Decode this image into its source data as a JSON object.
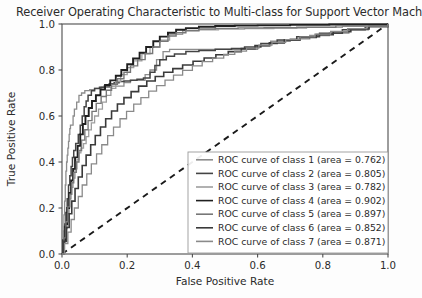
{
  "chart_data": {
    "type": "line",
    "title": "Receiver Operating Characteristic to Multi-class for Support Vector Machin",
    "xlabel": "False Positive Rate",
    "ylabel": "True Positive Rate",
    "xlim": [
      0.0,
      1.0
    ],
    "ylim": [
      0.0,
      1.0
    ],
    "xticks": [
      "0.0",
      "0.2",
      "0.4",
      "0.6",
      "0.8",
      "1.0"
    ],
    "yticks": [
      "0.0",
      "0.2",
      "0.4",
      "0.6",
      "0.8",
      "1.0"
    ],
    "xtick_values": [
      0.0,
      0.2,
      0.4,
      0.6,
      0.8,
      1.0
    ],
    "ytick_values": [
      0.0,
      0.2,
      0.4,
      0.6,
      0.8,
      1.0
    ],
    "grid": false,
    "legend_position": "lower right",
    "reference_line": {
      "name": "chance-diagonal",
      "style": "dashed",
      "color": "#1a1a1a",
      "points": [
        [
          0.0,
          0.0
        ],
        [
          1.0,
          1.0
        ]
      ]
    },
    "series": [
      {
        "name": "ROC curve of class 1",
        "label": "ROC curve of class 1 (area = 0.762)",
        "area": 0.762,
        "color": "#8c8c8c",
        "width": 1.3,
        "points": [
          [
            0.0,
            0.0
          ],
          [
            0.004,
            0.1
          ],
          [
            0.006,
            0.17
          ],
          [
            0.008,
            0.23
          ],
          [
            0.01,
            0.3
          ],
          [
            0.012,
            0.36
          ],
          [
            0.014,
            0.4
          ],
          [
            0.016,
            0.43
          ],
          [
            0.018,
            0.46
          ],
          [
            0.02,
            0.49
          ],
          [
            0.022,
            0.52
          ],
          [
            0.024,
            0.545
          ],
          [
            0.026,
            0.56
          ],
          [
            0.03,
            0.56
          ],
          [
            0.034,
            0.6
          ],
          [
            0.038,
            0.63
          ],
          [
            0.045,
            0.66
          ],
          [
            0.052,
            0.69
          ],
          [
            0.06,
            0.7
          ],
          [
            0.07,
            0.71
          ],
          [
            0.085,
            0.715
          ],
          [
            0.1,
            0.72
          ],
          [
            0.12,
            0.725
          ],
          [
            0.15,
            0.73
          ],
          [
            0.19,
            0.745
          ],
          [
            0.21,
            0.755
          ],
          [
            0.23,
            0.755
          ],
          [
            0.255,
            0.78
          ],
          [
            0.27,
            0.8
          ],
          [
            0.29,
            0.845
          ],
          [
            0.31,
            0.88
          ],
          [
            0.33,
            0.89
          ],
          [
            0.4,
            0.89
          ],
          [
            0.5,
            0.89
          ],
          [
            0.56,
            0.89
          ],
          [
            0.6,
            0.905
          ],
          [
            0.64,
            0.925
          ],
          [
            0.7,
            0.935
          ],
          [
            0.76,
            0.95
          ],
          [
            0.82,
            0.96
          ],
          [
            0.88,
            0.975
          ],
          [
            0.94,
            0.99
          ],
          [
            1.0,
            1.0
          ]
        ]
      },
      {
        "name": "ROC curve of class 2",
        "label": "ROC curve of class 2 (area = 0.805)",
        "area": 0.805,
        "color": "#444444",
        "width": 1.5,
        "points": [
          [
            0.0,
            0.0
          ],
          [
            0.004,
            0.06
          ],
          [
            0.008,
            0.12
          ],
          [
            0.012,
            0.18
          ],
          [
            0.016,
            0.24
          ],
          [
            0.02,
            0.3
          ],
          [
            0.024,
            0.34
          ],
          [
            0.028,
            0.38
          ],
          [
            0.032,
            0.42
          ],
          [
            0.036,
            0.45
          ],
          [
            0.042,
            0.48
          ],
          [
            0.05,
            0.52
          ],
          [
            0.056,
            0.56
          ],
          [
            0.062,
            0.6
          ],
          [
            0.068,
            0.64
          ],
          [
            0.074,
            0.665
          ],
          [
            0.08,
            0.69
          ],
          [
            0.09,
            0.71
          ],
          [
            0.1,
            0.72
          ],
          [
            0.115,
            0.725
          ],
          [
            0.13,
            0.73
          ],
          [
            0.145,
            0.74
          ],
          [
            0.16,
            0.745
          ],
          [
            0.175,
            0.75
          ],
          [
            0.19,
            0.752
          ],
          [
            0.21,
            0.755
          ],
          [
            0.23,
            0.76
          ],
          [
            0.25,
            0.765
          ],
          [
            0.27,
            0.79
          ],
          [
            0.285,
            0.82
          ],
          [
            0.3,
            0.845
          ],
          [
            0.32,
            0.86
          ],
          [
            0.345,
            0.87
          ],
          [
            0.38,
            0.88
          ],
          [
            0.42,
            0.885
          ],
          [
            0.47,
            0.89
          ],
          [
            0.52,
            0.893
          ],
          [
            0.56,
            0.9
          ],
          [
            0.61,
            0.915
          ],
          [
            0.66,
            0.93
          ],
          [
            0.72,
            0.945
          ],
          [
            0.79,
            0.96
          ],
          [
            0.86,
            0.975
          ],
          [
            0.93,
            0.988
          ],
          [
            1.0,
            1.0
          ]
        ]
      },
      {
        "name": "ROC curve of class 3",
        "label": "ROC curve of class 3 (area = 0.782)",
        "area": 0.782,
        "color": "#9e9e9e",
        "width": 1.3,
        "points": [
          [
            0.0,
            0.0
          ],
          [
            0.004,
            0.05
          ],
          [
            0.01,
            0.11
          ],
          [
            0.016,
            0.175
          ],
          [
            0.022,
            0.24
          ],
          [
            0.028,
            0.29
          ],
          [
            0.034,
            0.33
          ],
          [
            0.04,
            0.37
          ],
          [
            0.046,
            0.41
          ],
          [
            0.052,
            0.44
          ],
          [
            0.058,
            0.46
          ],
          [
            0.066,
            0.48
          ],
          [
            0.074,
            0.51
          ],
          [
            0.082,
            0.54
          ],
          [
            0.09,
            0.57
          ],
          [
            0.1,
            0.6
          ],
          [
            0.112,
            0.63
          ],
          [
            0.124,
            0.66
          ],
          [
            0.136,
            0.69
          ],
          [
            0.15,
            0.72
          ],
          [
            0.165,
            0.75
          ],
          [
            0.18,
            0.78
          ],
          [
            0.2,
            0.81
          ],
          [
            0.22,
            0.84
          ],
          [
            0.245,
            0.87
          ],
          [
            0.27,
            0.9
          ],
          [
            0.3,
            0.93
          ],
          [
            0.33,
            0.955
          ],
          [
            0.37,
            0.97
          ],
          [
            0.42,
            0.975
          ],
          [
            0.48,
            0.978
          ],
          [
            0.56,
            0.98
          ],
          [
            0.65,
            0.982
          ],
          [
            0.75,
            0.985
          ],
          [
            0.86,
            0.99
          ],
          [
            1.0,
            1.0
          ]
        ]
      },
      {
        "name": "ROC curve of class 4",
        "label": "ROC curve of class 4 (area = 0.902)",
        "area": 0.902,
        "color": "#1f1f1f",
        "width": 1.9,
        "points": [
          [
            0.0,
            0.0
          ],
          [
            0.004,
            0.06
          ],
          [
            0.01,
            0.13
          ],
          [
            0.016,
            0.2
          ],
          [
            0.022,
            0.265
          ],
          [
            0.028,
            0.32
          ],
          [
            0.034,
            0.37
          ],
          [
            0.04,
            0.42
          ],
          [
            0.048,
            0.47
          ],
          [
            0.056,
            0.52
          ],
          [
            0.064,
            0.565
          ],
          [
            0.072,
            0.6
          ],
          [
            0.082,
            0.635
          ],
          [
            0.092,
            0.665
          ],
          [
            0.104,
            0.69
          ],
          [
            0.118,
            0.715
          ],
          [
            0.132,
            0.735
          ],
          [
            0.148,
            0.755
          ],
          [
            0.165,
            0.775
          ],
          [
            0.182,
            0.8
          ],
          [
            0.2,
            0.825
          ],
          [
            0.218,
            0.85
          ],
          [
            0.238,
            0.875
          ],
          [
            0.258,
            0.9
          ],
          [
            0.28,
            0.925
          ],
          [
            0.3,
            0.945
          ],
          [
            0.325,
            0.962
          ],
          [
            0.35,
            0.975
          ],
          [
            0.38,
            0.982
          ],
          [
            0.42,
            0.988
          ],
          [
            0.47,
            0.991
          ],
          [
            0.53,
            0.993
          ],
          [
            0.6,
            0.994
          ],
          [
            0.7,
            0.996
          ],
          [
            0.82,
            0.998
          ],
          [
            1.0,
            1.0
          ]
        ]
      },
      {
        "name": "ROC curve of class 5",
        "label": "ROC curve of class 5 (area = 0.897)",
        "area": 0.897,
        "color": "#777777",
        "width": 1.4,
        "points": [
          [
            0.0,
            0.0
          ],
          [
            0.006,
            0.07
          ],
          [
            0.012,
            0.14
          ],
          [
            0.018,
            0.205
          ],
          [
            0.024,
            0.26
          ],
          [
            0.03,
            0.31
          ],
          [
            0.036,
            0.355
          ],
          [
            0.044,
            0.4
          ],
          [
            0.052,
            0.45
          ],
          [
            0.06,
            0.495
          ],
          [
            0.07,
            0.54
          ],
          [
            0.08,
            0.58
          ],
          [
            0.092,
            0.62
          ],
          [
            0.105,
            0.655
          ],
          [
            0.12,
            0.685
          ],
          [
            0.136,
            0.712
          ],
          [
            0.152,
            0.738
          ],
          [
            0.17,
            0.762
          ],
          [
            0.19,
            0.79
          ],
          [
            0.21,
            0.818
          ],
          [
            0.232,
            0.845
          ],
          [
            0.255,
            0.872
          ],
          [
            0.278,
            0.9
          ],
          [
            0.3,
            0.925
          ],
          [
            0.325,
            0.948
          ],
          [
            0.35,
            0.962
          ],
          [
            0.38,
            0.972
          ],
          [
            0.42,
            0.978
          ],
          [
            0.47,
            0.981
          ],
          [
            0.54,
            0.983
          ],
          [
            0.62,
            0.984
          ],
          [
            0.72,
            0.986
          ],
          [
            0.84,
            0.992
          ],
          [
            1.0,
            1.0
          ]
        ]
      },
      {
        "name": "ROC curve of class 6",
        "label": "ROC curve of class 6 (area = 0.852)",
        "area": 0.852,
        "color": "#3a3a3a",
        "width": 1.6,
        "points": [
          [
            0.0,
            0.0
          ],
          [
            0.006,
            0.055
          ],
          [
            0.014,
            0.115
          ],
          [
            0.022,
            0.175
          ],
          [
            0.03,
            0.23
          ],
          [
            0.04,
            0.285
          ],
          [
            0.05,
            0.335
          ],
          [
            0.062,
            0.385
          ],
          [
            0.074,
            0.43
          ],
          [
            0.088,
            0.475
          ],
          [
            0.102,
            0.515
          ],
          [
            0.118,
            0.552
          ],
          [
            0.134,
            0.588
          ],
          [
            0.152,
            0.622
          ],
          [
            0.17,
            0.652
          ],
          [
            0.19,
            0.68
          ],
          [
            0.212,
            0.706
          ],
          [
            0.235,
            0.73
          ],
          [
            0.26,
            0.752
          ],
          [
            0.286,
            0.772
          ],
          [
            0.312,
            0.79
          ],
          [
            0.34,
            0.806
          ],
          [
            0.37,
            0.822
          ],
          [
            0.402,
            0.838
          ],
          [
            0.436,
            0.852
          ],
          [
            0.472,
            0.866
          ],
          [
            0.51,
            0.88
          ],
          [
            0.55,
            0.893
          ],
          [
            0.592,
            0.906
          ],
          [
            0.636,
            0.918
          ],
          [
            0.682,
            0.93
          ],
          [
            0.73,
            0.942
          ],
          [
            0.78,
            0.954
          ],
          [
            0.832,
            0.966
          ],
          [
            0.886,
            0.978
          ],
          [
            0.942,
            0.99
          ],
          [
            1.0,
            1.0
          ]
        ]
      },
      {
        "name": "ROC curve of class 7",
        "label": "ROC curve of class 7 (area = 0.871)",
        "area": 0.871,
        "color": "#8a8a8a",
        "width": 1.3,
        "points": [
          [
            0.0,
            0.0
          ],
          [
            0.008,
            0.045
          ],
          [
            0.018,
            0.095
          ],
          [
            0.028,
            0.15
          ],
          [
            0.038,
            0.2
          ],
          [
            0.05,
            0.25
          ],
          [
            0.062,
            0.3
          ],
          [
            0.076,
            0.348
          ],
          [
            0.09,
            0.392
          ],
          [
            0.106,
            0.435
          ],
          [
            0.122,
            0.475
          ],
          [
            0.14,
            0.515
          ],
          [
            0.158,
            0.552
          ],
          [
            0.178,
            0.588
          ],
          [
            0.198,
            0.62
          ],
          [
            0.22,
            0.652
          ],
          [
            0.242,
            0.68
          ],
          [
            0.266,
            0.708
          ],
          [
            0.29,
            0.732
          ],
          [
            0.316,
            0.756
          ],
          [
            0.342,
            0.778
          ],
          [
            0.37,
            0.798
          ],
          [
            0.4,
            0.818
          ],
          [
            0.43,
            0.836
          ],
          [
            0.462,
            0.852
          ],
          [
            0.496,
            0.868
          ],
          [
            0.53,
            0.882
          ],
          [
            0.566,
            0.895
          ],
          [
            0.604,
            0.908
          ],
          [
            0.644,
            0.92
          ],
          [
            0.686,
            0.932
          ],
          [
            0.73,
            0.944
          ],
          [
            0.776,
            0.956
          ],
          [
            0.824,
            0.968
          ],
          [
            0.876,
            0.98
          ],
          [
            0.934,
            0.991
          ],
          [
            1.0,
            1.0
          ]
        ]
      }
    ]
  }
}
